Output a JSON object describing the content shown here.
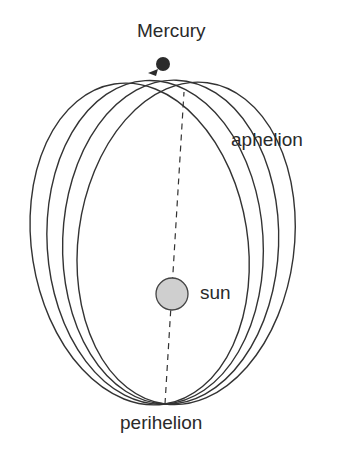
{
  "diagram": {
    "labels": {
      "mercury": "Mercury",
      "aphelion": "aphelion",
      "sun": "sun",
      "perihelion": "perihelion"
    },
    "colors": {
      "orbit_stroke": "#333333",
      "sun_fill": "#cfcfcf",
      "sun_stroke": "#444444",
      "mercury_fill": "#2b2b2b",
      "text": "#2a2a2a",
      "background": "#ffffff"
    },
    "orbits": {
      "count": 4,
      "shared_point": "perihelion",
      "rotation_degrees": [
        -9,
        -3.5,
        2,
        7.5
      ]
    },
    "axis_line": "dashed line from perihelion through sun to aphelion"
  }
}
